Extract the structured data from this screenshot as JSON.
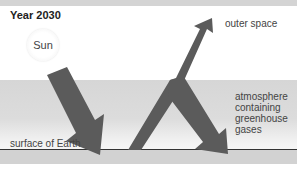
{
  "title": "Year 2030",
  "labels": {
    "sun": "Sun",
    "outer_space": "outer space",
    "atmosphere": "atmosphere containing greenhouse gases",
    "surface": "surface of Earth"
  },
  "colors": {
    "arrow": "#5b5b5b",
    "band": "#d6d6d6",
    "surface_line": "#333333"
  },
  "arrows": [
    {
      "name": "incoming-sunlight",
      "from": "sun",
      "to": "surface of Earth"
    },
    {
      "name": "reflected-to-space",
      "from": "surface of Earth",
      "to": "outer space"
    },
    {
      "name": "trapped-by-atmosphere",
      "from": "atmosphere",
      "to": "surface of Earth"
    }
  ]
}
